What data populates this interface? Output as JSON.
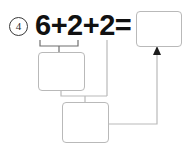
{
  "worksheet": {
    "problem_number": "4",
    "equation": "6+2+2=",
    "operands": [
      "6",
      "2",
      "2"
    ],
    "operators": [
      "+",
      "+"
    ],
    "equals_sign": "=",
    "boxes": {
      "answer": "",
      "partial_sum": "",
      "total_sum": ""
    }
  },
  "colors": {
    "box_border": "#b9b9b9",
    "connector": "#b9b9b9",
    "bracket": "#6f6f6f",
    "text": "#111111",
    "number_circle": "#3a3a3a",
    "background": "#ffffff"
  },
  "icons": {
    "arrow_up": "arrow-up-icon",
    "bracket_under_first_pair": "bracket-icon"
  }
}
